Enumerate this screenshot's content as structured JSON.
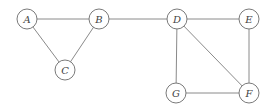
{
  "diagram": {
    "type": "undirected-graph",
    "node_radius": 10,
    "nodes": [
      {
        "id": "A",
        "label": "A",
        "x": 27,
        "y": 19
      },
      {
        "id": "B",
        "label": "B",
        "x": 99,
        "y": 19
      },
      {
        "id": "C",
        "label": "C",
        "x": 65,
        "y": 70
      },
      {
        "id": "D",
        "label": "D",
        "x": 177,
        "y": 19
      },
      {
        "id": "E",
        "label": "E",
        "x": 249,
        "y": 19
      },
      {
        "id": "F",
        "label": "F",
        "x": 249,
        "y": 93
      },
      {
        "id": "G",
        "label": "G",
        "x": 176,
        "y": 93
      }
    ],
    "edges": [
      [
        "A",
        "B"
      ],
      [
        "A",
        "C"
      ],
      [
        "B",
        "C"
      ],
      [
        "B",
        "D"
      ],
      [
        "D",
        "E"
      ],
      [
        "D",
        "G"
      ],
      [
        "D",
        "F"
      ],
      [
        "E",
        "F"
      ],
      [
        "G",
        "F"
      ]
    ],
    "colors": {
      "stroke": "#7a7a7a",
      "edge": "#8a8a8a",
      "text": "#444444",
      "background": "#ffffff"
    }
  }
}
